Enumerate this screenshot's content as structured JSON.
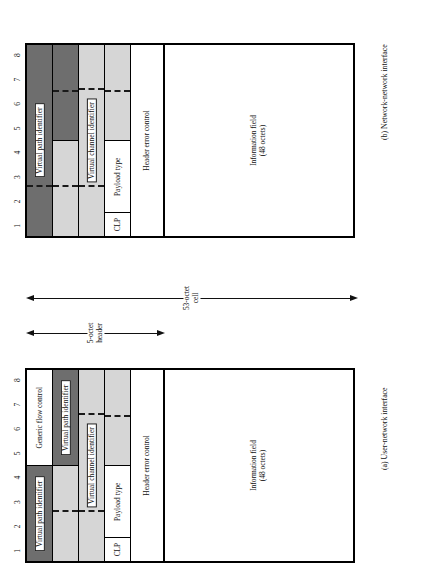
{
  "figure": {
    "bit_numbers": [
      "1",
      "2",
      "3",
      "4",
      "5",
      "6",
      "7",
      "8"
    ],
    "colors": {
      "vpi_fill": "#6e6e6e",
      "vci_fill": "#d6d6d6",
      "plain_fill": "#ffffff",
      "line": "#111111"
    }
  },
  "measures": {
    "header": {
      "line1": "5-octet",
      "line2": "header"
    },
    "cell": {
      "line1": "53-octet",
      "line2": "cell"
    }
  },
  "panels": [
    {
      "id": "unit",
      "caption": "(a) User-network interface",
      "octets": [
        {
          "index": 1,
          "segments": [
            {
              "label": "Generic flow control",
              "fill": "plain",
              "bits": 4,
              "dashed": false
            },
            {
              "label": "Virtual path identifier",
              "fill": "vpi",
              "bits": 4,
              "dashed": false
            }
          ]
        },
        {
          "index": 2,
          "segments": [
            {
              "label": "Virtual path identifier",
              "fill": "vpi",
              "bits": 4,
              "dashed": true
            },
            {
              "label": "Virtual channel identifier",
              "fill": "vci",
              "bits": 4,
              "dashed": true
            }
          ]
        },
        {
          "index": 3,
          "segments": [
            {
              "label": "Virtual channel identifier",
              "fill": "vci",
              "bits": 8,
              "dashed": true
            }
          ]
        },
        {
          "index": 4,
          "segments": [
            {
              "label": "Virtual channel identifier",
              "fill": "vci",
              "bits": 4,
              "dashed": true
            },
            {
              "label": "Payload type",
              "fill": "plain",
              "bits": 3,
              "dashed": false
            },
            {
              "label": "CLP",
              "fill": "plain",
              "bits": 1,
              "dashed": false
            }
          ]
        },
        {
          "index": 5,
          "segments": [
            {
              "label": "Header error control",
              "fill": "plain",
              "bits": 8,
              "dashed": false
            }
          ]
        },
        {
          "index": 6,
          "segments": [
            {
              "label": "Information field\n(48 octets)",
              "fill": "plain",
              "bits": 8,
              "dashed": false
            }
          ]
        }
      ],
      "labels": {
        "generic_flow_control": "Generic flow control",
        "virtual_path_identifier": "Virtual path identifier",
        "virtual_path_identifier_2": "Virtual path identifier",
        "virtual_channel_identifier": "Virtual channel identifier",
        "payload_type": "Payload type",
        "clp": "CLP",
        "header_error_control": "Header error control",
        "information_field_l1": "Information field",
        "information_field_l2": "(48 octets)"
      }
    },
    {
      "id": "nni",
      "caption": "(b) Network-network interface",
      "labels": {
        "virtual_path_identifier": "Virtual path identifier",
        "virtual_path_identifier_2": "Virtual path identifier",
        "virtual_channel_identifier": "Virtual channel identifier",
        "payload_type": "Payload type",
        "clp": "CLP",
        "header_error_control": "Header error control",
        "information_field_l1": "Information field",
        "information_field_l2": "(48 octets)"
      }
    }
  ]
}
